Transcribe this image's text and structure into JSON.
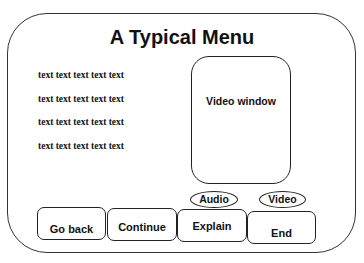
{
  "menu": {
    "title": "A Typical Menu",
    "text_lines": [
      "text text text text text",
      "text text text text text",
      "text text text text text",
      "text text text text text"
    ],
    "video_window_label": "Video window",
    "toggles": {
      "audio": "Audio",
      "video": "Video"
    },
    "buttons": {
      "go_back": "Go back",
      "continue": "Continue",
      "explain": "Explain",
      "end": "End"
    }
  }
}
